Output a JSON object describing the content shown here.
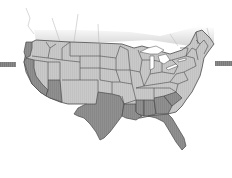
{
  "map": {
    "title": "United States",
    "colors": {
      "background": "#ffffff",
      "state_light": "#c8c8c8",
      "state_dark": "#8e8e8e",
      "border": "#4a4a4a",
      "lakes": "#ffffff",
      "canada_fade": "#e2e2e2",
      "side_bar": "#7a7a7a"
    },
    "highlighted_states": [
      "California",
      "Arizona",
      "Texas",
      "Louisiana",
      "Mississippi",
      "Alabama",
      "Georgia",
      "Florida",
      "South Carolina"
    ],
    "left_indicator": {
      "icon": "arrow-bar-left"
    },
    "right_indicator": {
      "icon": "arrow-bar-right"
    }
  }
}
